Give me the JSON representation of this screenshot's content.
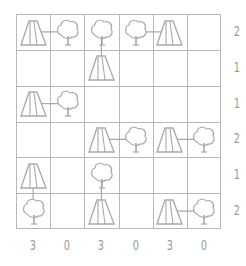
{
  "puzzle": {
    "name": "Tents",
    "rows": 6,
    "cols": 6,
    "grid": [
      [
        "tent",
        "tree",
        "tree",
        "tree",
        "tent",
        "empty"
      ],
      [
        "empty",
        "empty",
        "tent",
        "empty",
        "empty",
        "empty"
      ],
      [
        "tent",
        "tree",
        "empty",
        "empty",
        "empty",
        "empty"
      ],
      [
        "empty",
        "empty",
        "tent",
        "tree",
        "tent",
        "tree"
      ],
      [
        "tent",
        "empty",
        "tree",
        "empty",
        "empty",
        "empty"
      ],
      [
        "tree",
        "empty",
        "tent",
        "empty",
        "tent",
        "tree"
      ]
    ],
    "links": [
      {
        "from": [
          0,
          0
        ],
        "to": [
          0,
          1
        ]
      },
      {
        "from": [
          0,
          2
        ],
        "to": [
          1,
          2
        ]
      },
      {
        "from": [
          0,
          3
        ],
        "to": [
          0,
          4
        ]
      },
      {
        "from": [
          2,
          0
        ],
        "to": [
          2,
          1
        ]
      },
      {
        "from": [
          3,
          2
        ],
        "to": [
          3,
          3
        ]
      },
      {
        "from": [
          3,
          4
        ],
        "to": [
          3,
          5
        ]
      },
      {
        "from": [
          4,
          0
        ],
        "to": [
          5,
          0
        ]
      },
      {
        "from": [
          4,
          2
        ],
        "to": [
          5,
          2
        ]
      },
      {
        "from": [
          5,
          4
        ],
        "to": [
          5,
          5
        ]
      }
    ],
    "row_clues": [
      "2",
      "1",
      "1",
      "2",
      "1",
      "2"
    ],
    "col_clues": [
      "3",
      "0",
      "3",
      "0",
      "3",
      "0"
    ],
    "colors": {
      "line": "#b8b8b8",
      "icon": "#a8a8a8",
      "clue": "#9a9a9a"
    }
  }
}
